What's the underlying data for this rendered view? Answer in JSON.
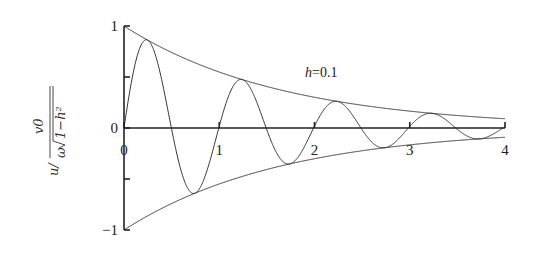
{
  "chart_data": {
    "type": "line",
    "title": "",
    "xlabel": "",
    "ylabel": "u / (v0 / (ω√(1−h²)))",
    "ylabel_parts": {
      "prefix": "u/",
      "numerator": "v0",
      "denominator_omega": "ω",
      "denominator_radicand": "1−h²"
    },
    "xlim": [
      0,
      4
    ],
    "ylim": [
      -1,
      1
    ],
    "grid": false,
    "x_ticks": [
      0,
      1,
      2,
      3,
      4
    ],
    "x_tick_labels": [
      "0",
      "1",
      "2",
      "3",
      "4"
    ],
    "y_ticks": [
      -1,
      -0.5,
      0,
      0.5,
      1
    ],
    "y_tick_labels": [
      "−1",
      "",
      "0",
      "",
      "1"
    ],
    "annotations": [
      {
        "text": "h=0.1",
        "x": 2.0,
        "y": 0.55
      }
    ],
    "series": [
      {
        "name": "upper envelope e^(−hωt)",
        "formula": "exp(-0.6 t)"
      },
      {
        "name": "lower envelope −e^(−hωt)",
        "formula": "-exp(-0.6 t)"
      },
      {
        "name": "response u(t)",
        "formula": "exp(-0.6 t) * sin(2π·1.005 t)"
      }
    ],
    "key_points": {
      "response_peaks": [
        {
          "t": 0.25,
          "u": 0.86
        },
        {
          "t": 1.24,
          "u": 0.52
        },
        {
          "t": 2.23,
          "u": 0.28
        },
        {
          "t": 3.22,
          "u": 0.15
        }
      ],
      "response_troughs": [
        {
          "t": 0.74,
          "u": -0.63
        },
        {
          "t": 1.73,
          "u": -0.35
        },
        {
          "t": 2.72,
          "u": -0.19
        },
        {
          "t": 3.71,
          "u": -0.1
        }
      ],
      "envelope_at": [
        {
          "t": 0,
          "u": 1.0
        },
        {
          "t": 1,
          "u": 0.55
        },
        {
          "t": 2,
          "u": 0.3
        },
        {
          "t": 3,
          "u": 0.17
        },
        {
          "t": 4,
          "u": 0.09
        }
      ]
    },
    "params": {
      "decay_rate": 0.6,
      "frequency": 1.005
    }
  }
}
